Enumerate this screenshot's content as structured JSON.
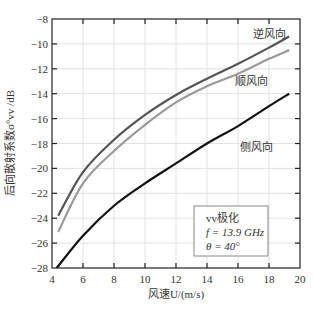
{
  "chart_data": {
    "type": "line",
    "title": "",
    "xlabel": "风速U/(m/s)",
    "ylabel": "后向散射系数σ°vv /dB",
    "xlim": [
      4,
      20
    ],
    "ylim": [
      -28,
      -8
    ],
    "xticks": [
      4,
      6,
      8,
      10,
      12,
      14,
      16,
      18,
      20
    ],
    "yticks": [
      -28,
      -26,
      -24,
      -22,
      -20,
      -18,
      -16,
      -14,
      -12,
      -10,
      -8
    ],
    "grid": true,
    "series": [
      {
        "name": "逆风向",
        "color": "#555555",
        "x": [
          4.4,
          6,
          8,
          10,
          12,
          14,
          16,
          18,
          19.3
        ],
        "y": [
          -23.8,
          -20.3,
          -17.7,
          -15.7,
          -14.1,
          -12.8,
          -11.6,
          -10.3,
          -9.4
        ]
      },
      {
        "name": "顺风向",
        "color": "#9a9a9a",
        "x": [
          4.4,
          6,
          8,
          10,
          12,
          14,
          16,
          18,
          19.3
        ],
        "y": [
          -25.1,
          -21.2,
          -18.6,
          -16.5,
          -14.7,
          -13.4,
          -12.4,
          -11.2,
          -10.5
        ]
      },
      {
        "name": "侧风向",
        "color": "#111111",
        "x": [
          4.3,
          6,
          8,
          10,
          12,
          14,
          16,
          18,
          19.3
        ],
        "y": [
          -28.0,
          -25.4,
          -23.0,
          -21.2,
          -19.6,
          -18.0,
          -16.6,
          -15.0,
          -14.0
        ]
      }
    ],
    "annotations": [
      {
        "text": "逆风向",
        "x": 18.0,
        "y": -9.5
      },
      {
        "text": "顺风向",
        "x": 16.9,
        "y": -13.3
      },
      {
        "text": "侧风向",
        "x": 17.2,
        "y": -18.6
      }
    ],
    "legend_box": {
      "lines": [
        "vv极化",
        "f = 13.9 GHz",
        "θ = 40°"
      ],
      "placement": "bottom-right"
    }
  }
}
